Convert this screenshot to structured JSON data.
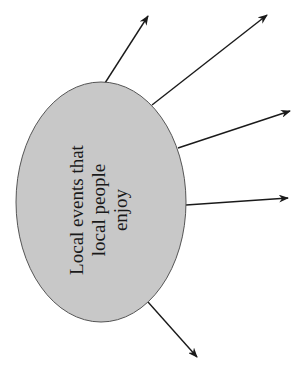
{
  "diagram": {
    "type": "spider-diagram",
    "center_node": {
      "label_lines": [
        "Local events that",
        "local people",
        "enjoy"
      ],
      "shape": "ellipse",
      "cx": 101,
      "cy": 202,
      "rx": 85,
      "ry": 120,
      "fill": "#c8c8c8",
      "stroke": "#555555",
      "text_rotation": -90
    },
    "arrows": [
      {
        "x1": 105,
        "y1": 83,
        "x2": 148,
        "y2": 16
      },
      {
        "x1": 152,
        "y1": 105,
        "x2": 267,
        "y2": 15
      },
      {
        "x1": 178,
        "y1": 148,
        "x2": 290,
        "y2": 111
      },
      {
        "x1": 186,
        "y1": 205,
        "x2": 288,
        "y2": 198
      },
      {
        "x1": 148,
        "y1": 302,
        "x2": 197,
        "y2": 357
      }
    ],
    "arrow_color": "#1a1a1a"
  }
}
